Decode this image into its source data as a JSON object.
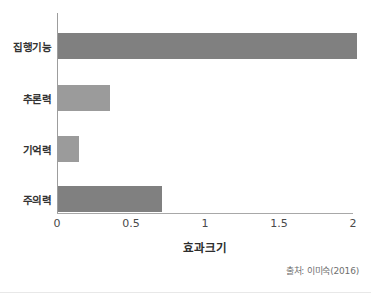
{
  "chart_data": {
    "type": "bar",
    "orientation": "horizontal",
    "title": "",
    "xlabel": "효과크기",
    "ylabel": "",
    "categories": [
      "집행기능",
      "추론력",
      "기억력",
      "주의력"
    ],
    "values": [
      2.02,
      0.35,
      0.14,
      0.7
    ],
    "series": [
      {
        "name": "효과크기",
        "values": [
          2.02,
          0.35,
          0.14,
          0.7
        ]
      }
    ],
    "xlim": [
      0,
      2.0
    ],
    "xticks": [
      0,
      0.5,
      1,
      1.5,
      2
    ],
    "xtick_labels": [
      "0",
      "0.5",
      "1",
      "1.5",
      "2"
    ],
    "grid": false,
    "legend": false,
    "bar_colors": [
      "#808080",
      "#9b9b9b",
      "#9b9b9b",
      "#808080"
    ],
    "annotations": {
      "source": "출처: 이미숙(2016)"
    }
  }
}
